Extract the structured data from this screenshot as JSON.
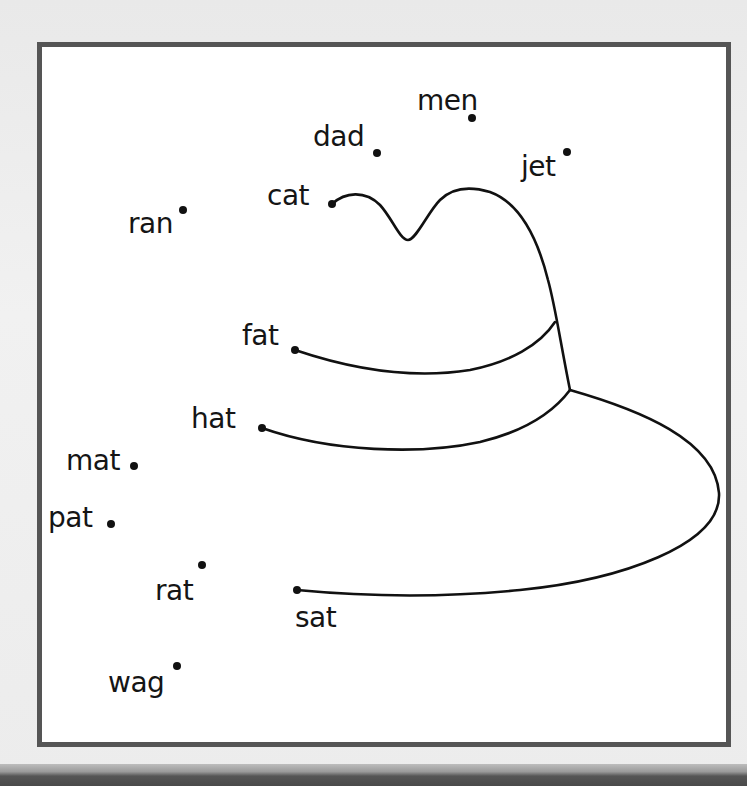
{
  "worksheet": {
    "title": "Connect-the-dots: Cat in the Hat",
    "words": [
      {
        "id": "men",
        "label": "men",
        "label_x": 417,
        "label_y": 110,
        "dot_x": 472,
        "dot_y": 118
      },
      {
        "id": "dad",
        "label": "dad",
        "label_x": 313,
        "label_y": 146,
        "dot_x": 377,
        "dot_y": 153
      },
      {
        "id": "jet",
        "label": "jet",
        "label_x": 521,
        "label_y": 176,
        "dot_x": 567,
        "dot_y": 152
      },
      {
        "id": "cat",
        "label": "cat",
        "label_x": 267,
        "label_y": 205,
        "dot_x": 332,
        "dot_y": 204
      },
      {
        "id": "ran",
        "label": "ran",
        "label_x": 128,
        "label_y": 233,
        "dot_x": 183,
        "dot_y": 210
      },
      {
        "id": "fat",
        "label": "fat",
        "label_x": 242,
        "label_y": 345,
        "dot_x": 295,
        "dot_y": 350
      },
      {
        "id": "hat",
        "label": "hat",
        "label_x": 191,
        "label_y": 428,
        "dot_x": 262,
        "dot_y": 428
      },
      {
        "id": "mat",
        "label": "mat",
        "label_x": 66,
        "label_y": 470,
        "dot_x": 134,
        "dot_y": 466
      },
      {
        "id": "pat",
        "label": "pat",
        "label_x": 48,
        "label_y": 527,
        "dot_x": 111,
        "dot_y": 524
      },
      {
        "id": "rat",
        "label": "rat",
        "label_x": 155,
        "label_y": 600,
        "dot_x": 202,
        "dot_y": 565
      },
      {
        "id": "sat",
        "label": "sat",
        "label_x": 295,
        "label_y": 627,
        "dot_x": 297,
        "dot_y": 590
      },
      {
        "id": "wag",
        "label": "wag",
        "label_x": 108,
        "label_y": 692,
        "dot_x": 177,
        "dot_y": 666
      }
    ],
    "colors": {
      "ink": "#111111",
      "frame": "#555555",
      "paper": "#ffffff",
      "background": "#ececec"
    }
  }
}
